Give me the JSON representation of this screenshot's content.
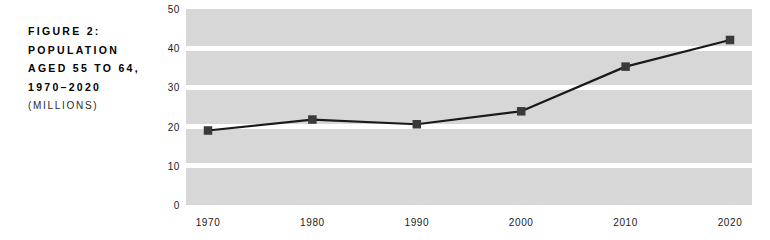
{
  "figure": {
    "caption_lines": [
      "FIGURE 2:",
      "POPULATION",
      "AGED 55 TO 64,",
      "1970–2020"
    ],
    "units": "(MILLIONS)"
  },
  "chart_data": {
    "type": "line",
    "title": "FIGURE 2: POPULATION AGED 55 TO 64, 1970–2020",
    "subtitle": "(MILLIONS)",
    "xlabel": "",
    "ylabel": "",
    "categories": [
      "1970",
      "1980",
      "1990",
      "2000",
      "2010",
      "2020"
    ],
    "x": [
      1970,
      1980,
      1990,
      2000,
      2010,
      2020
    ],
    "values": [
      19.0,
      21.8,
      20.6,
      23.9,
      35.3,
      42.1
    ],
    "series": [
      {
        "name": "Population aged 55 to 64",
        "values": [
          19.0,
          21.8,
          20.6,
          23.9,
          35.3,
          42.1
        ]
      }
    ],
    "ylim": [
      0,
      50
    ],
    "yticks": [
      0,
      10,
      20,
      30,
      40,
      50
    ],
    "ytick_labels": [
      "0",
      "10",
      "20",
      "30",
      "40",
      "50"
    ],
    "xtick_labels": [
      "1970",
      "1980",
      "1990",
      "2000",
      "2010",
      "2020"
    ],
    "grid": true,
    "grid_orientation": "horizontal",
    "legend": false,
    "marker": "square",
    "colors": {
      "plot_background": "#d7d7d7",
      "gridline": "#ffffff",
      "line": "#1a1a1a",
      "marker": "#3a3a3a",
      "text": "#000000",
      "page_background": "#ffffff"
    }
  }
}
